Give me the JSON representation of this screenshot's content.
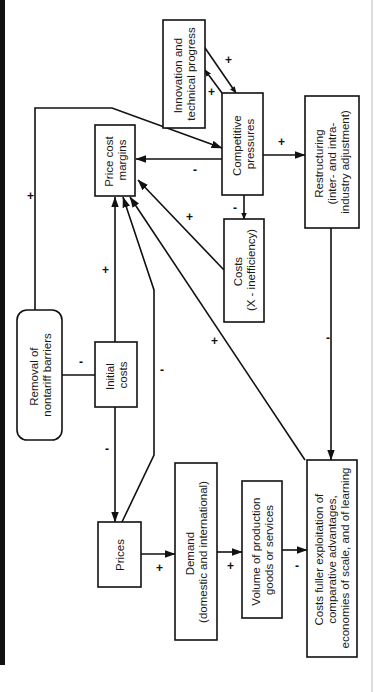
{
  "diagram": {
    "orientation": "rotated-90-ccw",
    "colors": {
      "ink": "#111111",
      "background": "#ffffff",
      "edge_rule": "#bdbdbd"
    },
    "nodes": {
      "innovation": {
        "lines": [
          "Innovation and",
          "technical progress"
        ]
      },
      "competitive": {
        "lines": [
          "Competitive",
          "pressures"
        ]
      },
      "price_cost_margins": {
        "lines": [
          "Price cost",
          "margins"
        ]
      },
      "restructuring": {
        "lines": [
          "Restructuring",
          "(inter-  and intra-",
          "industry adjustment)"
        ]
      },
      "costs_x": {
        "lines": [
          "Costs",
          "(X - inefficiency)"
        ]
      },
      "removal": {
        "lines": [
          "Removal of",
          "nontariff barriers"
        ]
      },
      "initial_costs": {
        "lines": [
          "Initial",
          "costs"
        ]
      },
      "prices": {
        "lines": [
          "Prices"
        ]
      },
      "demand": {
        "lines": [
          "Demand",
          "(domestic and international)"
        ]
      },
      "volume": {
        "lines": [
          "Volume of production",
          "goods or services"
        ]
      },
      "costs_fuller": {
        "lines": [
          "Costs fuller exploitation of",
          "comparative advantages,",
          "economies of scale, and of learning"
        ]
      }
    },
    "signs": {
      "removal_to_competitive": "+",
      "removal_to_initial": "-",
      "innovation_to_competitive": "+",
      "competitive_to_innovation": "+",
      "competitive_to_margins": "-",
      "competitive_to_restructuring": "+",
      "competitive_to_costs_x": "-",
      "costs_x_to_margins": "+",
      "initial_to_margins": "+",
      "initial_to_prices": "-",
      "prices_to_margins": "-",
      "costs_fuller_to_margins": "+",
      "restructuring_to_costs_fuller": "-",
      "prices_to_demand": "+",
      "demand_to_volume": "+",
      "volume_to_costs_fuller": "-"
    }
  }
}
